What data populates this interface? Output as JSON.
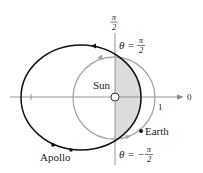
{
  "figure": {
    "type": "polar-diagram",
    "labels": {
      "sun": "Sun",
      "earth": "Earth",
      "apollo": "Apollo",
      "polar_axis_zero": "0",
      "unit_tick": "1",
      "top_axis_num": "π",
      "top_axis_den": "2",
      "theta_top_lhs": "θ =",
      "theta_top_num": "π",
      "theta_top_den": "2",
      "theta_bottom_lhs": "θ = −",
      "theta_bottom_num": "π",
      "theta_bottom_den": "2"
    },
    "colors": {
      "apollo_orbit": "#111111",
      "earth_orbit": "#a6a6a6",
      "axes": "#888888",
      "shaded_region": "#dcdcdc",
      "text": "#222222"
    },
    "geometry": {
      "origin": [
        115,
        97
      ],
      "earth_orbit": {
        "cx": 114,
        "cy": 98,
        "r": 41
      },
      "apollo_orbit": {
        "cx": 81,
        "cy": 97.5,
        "rx": 60,
        "ry": 52.5
      },
      "earth_position": [
        141,
        131
      ],
      "apollo_positions": [
        [
          53,
          145
        ],
        [
          71,
          150
        ]
      ]
    }
  }
}
